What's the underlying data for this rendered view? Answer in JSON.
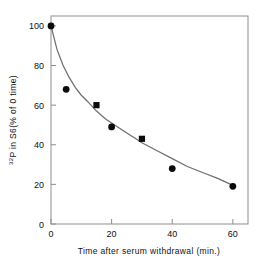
{
  "chart_data": {
    "type": "scatter",
    "title": "",
    "xlabel": "Time after serum withdrawal (min.)",
    "ylabel": "32P in S6(% of 0 time)",
    "ylabel_superscript": "32",
    "ylabel_rest": "P in S6(% of 0 time)",
    "xlim": [
      0,
      65
    ],
    "ylim": [
      0,
      105
    ],
    "xticks": [
      0,
      20,
      40,
      60
    ],
    "xtick_labels": [
      "0",
      "20",
      "40",
      "60"
    ],
    "yticks": [
      0,
      20,
      40,
      60,
      80,
      100
    ],
    "ytick_labels": [
      "0",
      "20",
      "40",
      "60",
      "80",
      "100"
    ],
    "grid": false,
    "legend": null,
    "frame": "box",
    "series": [
      {
        "name": "circle-markers",
        "marker": "circle",
        "color": "#0a0a0a",
        "points": [
          {
            "x": 0,
            "y": 100
          },
          {
            "x": 5,
            "y": 68
          },
          {
            "x": 20,
            "y": 49
          },
          {
            "x": 40,
            "y": 28
          },
          {
            "x": 60,
            "y": 19
          }
        ]
      },
      {
        "name": "square-markers",
        "marker": "square",
        "color": "#0a0a0a",
        "points": [
          {
            "x": 15,
            "y": 60
          },
          {
            "x": 30,
            "y": 43
          }
        ]
      }
    ],
    "fit_curve": {
      "name": "exponential-decay-fit",
      "color": "#6e6e6e",
      "points": [
        {
          "x": 0,
          "y": 100
        },
        {
          "x": 2,
          "y": 88
        },
        {
          "x": 4,
          "y": 80
        },
        {
          "x": 6,
          "y": 74
        },
        {
          "x": 8,
          "y": 69
        },
        {
          "x": 10,
          "y": 65
        },
        {
          "x": 12,
          "y": 62
        },
        {
          "x": 15,
          "y": 57
        },
        {
          "x": 18,
          "y": 53
        },
        {
          "x": 20,
          "y": 51
        },
        {
          "x": 24,
          "y": 47
        },
        {
          "x": 28,
          "y": 43
        },
        {
          "x": 30,
          "y": 41
        },
        {
          "x": 35,
          "y": 37
        },
        {
          "x": 40,
          "y": 33
        },
        {
          "x": 45,
          "y": 29
        },
        {
          "x": 50,
          "y": 26
        },
        {
          "x": 55,
          "y": 23
        },
        {
          "x": 60,
          "y": 19.5
        }
      ]
    }
  }
}
